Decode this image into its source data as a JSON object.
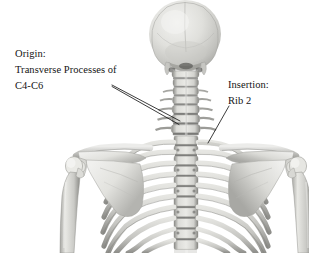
{
  "figure": {
    "background_color": "#ffffff",
    "width": 309,
    "height": 253,
    "text_color": "#141414",
    "leader_line_color": "#1a1a1a"
  },
  "annotations": {
    "origin": {
      "heading": "Origin:",
      "detail_line_1": "Transverse Processes of",
      "detail_line_2": "C4-C6",
      "full_text": "Origin: Transverse Processes of C4-C6",
      "leader_count": 2,
      "target": "cervical-transverse-processes"
    },
    "insertion": {
      "heading": "Insertion:",
      "detail_line_1": "Rib 2",
      "full_text": "Insertion: Rib 2",
      "leader_count": 1,
      "target": "rib-2"
    }
  },
  "bone_palette": {
    "highlight": "#ededea",
    "light": "#dcdcd8",
    "mid": "#bdbdb9",
    "mid_dark": "#9a9a96",
    "shadow": "#6e6e6a",
    "deep_shadow": "#4a4a47",
    "outline": "#8b8b87"
  }
}
